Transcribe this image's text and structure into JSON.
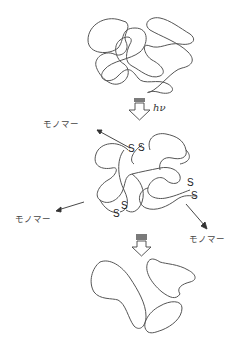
{
  "diagram": {
    "type": "process",
    "stages": [
      {
        "id": "initial",
        "label": "Entangled polymer network"
      },
      {
        "id": "irradiated",
        "label": "Network with S-S bonds cleaving, releasing monomers"
      },
      {
        "id": "final",
        "label": "Separated polymer fragments"
      }
    ],
    "arrows": {
      "step1_label": "hν",
      "step2_label": ""
    },
    "monomer_label": "モノマー",
    "labels": {
      "monomer_top_left": "モノマー",
      "monomer_left": "モノマー",
      "monomer_right": "モノマー",
      "hv": "hν",
      "s": "S"
    }
  }
}
